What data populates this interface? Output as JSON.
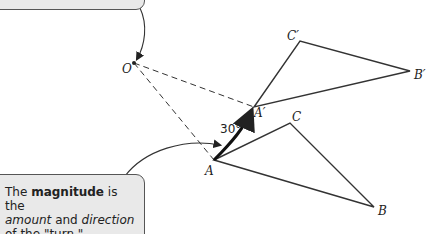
{
  "diagram": {
    "points": {
      "O": {
        "label": "O",
        "x": 134,
        "y": 63
      },
      "A": {
        "label": "A",
        "x": 214,
        "y": 160
      },
      "B": {
        "label": "B",
        "x": 374,
        "y": 207
      },
      "C": {
        "label": "C",
        "x": 290,
        "y": 123
      },
      "A_prime": {
        "label": "A′",
        "x": 254,
        "y": 107
      },
      "B_prime": {
        "label": "B′",
        "x": 410,
        "y": 71
      },
      "C_prime": {
        "label": "C′",
        "x": 300,
        "y": 41
      }
    },
    "angle_label": "30°",
    "callout_bottom": {
      "prefix": "The ",
      "bold": "magnitude",
      "mid": " is the",
      "italic1": "amount",
      "and": " and ",
      "italic2": "direction",
      "suffix": "of the \"turn.\""
    },
    "colors": {
      "line": "#333333",
      "callout_fill": "#e9e9e9"
    }
  }
}
